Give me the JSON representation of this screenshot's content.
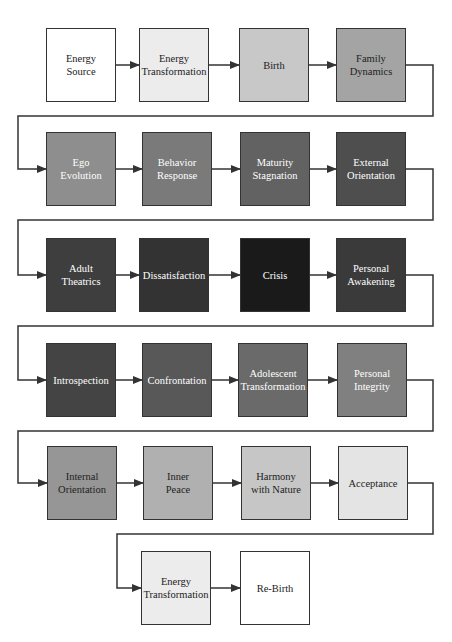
{
  "diagram": {
    "type": "flow-cycle",
    "nodes": [
      {
        "id": "n1",
        "label": "Energy\nSource",
        "fill": "#ffffff",
        "text": "#222222",
        "x": 46,
        "y": 28
      },
      {
        "id": "n2",
        "label": "Energy\nTransformation",
        "fill": "#ececec",
        "text": "#222222",
        "x": 139,
        "y": 28
      },
      {
        "id": "n3",
        "label": "Birth",
        "fill": "#c8c8c8",
        "text": "#222222",
        "x": 239,
        "y": 28
      },
      {
        "id": "n4",
        "label": "Family\nDynamics",
        "fill": "#a4a4a4",
        "text": "#222222",
        "x": 336,
        "y": 28
      },
      {
        "id": "n5",
        "label": "Ego\nEvolution",
        "fill": "#8e8e8e",
        "text": "#ffffff",
        "x": 46,
        "y": 132
      },
      {
        "id": "n6",
        "label": "Behavior\nResponse",
        "fill": "#7a7a7a",
        "text": "#ffffff",
        "x": 142,
        "y": 132
      },
      {
        "id": "n7",
        "label": "Maturity\nStagnation",
        "fill": "#626262",
        "text": "#ffffff",
        "x": 240,
        "y": 132
      },
      {
        "id": "n8",
        "label": "External\nOrientation",
        "fill": "#4e4e4e",
        "text": "#ffffff",
        "x": 336,
        "y": 132
      },
      {
        "id": "n9",
        "label": "Adult\nTheatrics",
        "fill": "#3e3e3e",
        "text": "#ffffff",
        "x": 46,
        "y": 238
      },
      {
        "id": "n10",
        "label": "Dissatisfaction",
        "fill": "#333333",
        "text": "#ffffff",
        "x": 139,
        "y": 238
      },
      {
        "id": "n11",
        "label": "Crisis",
        "fill": "#1a1a1a",
        "text": "#ffffff",
        "x": 240,
        "y": 238
      },
      {
        "id": "n12",
        "label": "Personal\nAwakening",
        "fill": "#3a3a3a",
        "text": "#ffffff",
        "x": 336,
        "y": 238
      },
      {
        "id": "n13",
        "label": "Introspection",
        "fill": "#444444",
        "text": "#ffffff",
        "x": 46,
        "y": 343
      },
      {
        "id": "n14",
        "label": "Confrontation",
        "fill": "#585858",
        "text": "#ffffff",
        "x": 142,
        "y": 343
      },
      {
        "id": "n15",
        "label": "Adolescent\nTransformation",
        "fill": "#6a6a6a",
        "text": "#ffffff",
        "x": 238,
        "y": 343
      },
      {
        "id": "n16",
        "label": "Personal\nIntegrity",
        "fill": "#808080",
        "text": "#ffffff",
        "x": 337,
        "y": 343
      },
      {
        "id": "n17",
        "label": "Internal\nOrientation",
        "fill": "#969696",
        "text": "#222222",
        "x": 47,
        "y": 446
      },
      {
        "id": "n18",
        "label": "Inner\nPeace",
        "fill": "#b0b0b0",
        "text": "#222222",
        "x": 143,
        "y": 446
      },
      {
        "id": "n19",
        "label": "Harmony\nwith Nature",
        "fill": "#c6c6c6",
        "text": "#222222",
        "x": 241,
        "y": 446
      },
      {
        "id": "n20",
        "label": "Acceptance",
        "fill": "#e4e4e4",
        "text": "#222222",
        "x": 338,
        "y": 446
      },
      {
        "id": "n21",
        "label": "Energy\nTransformation",
        "fill": "#ececec",
        "text": "#222222",
        "x": 141,
        "y": 551
      },
      {
        "id": "n22",
        "label": "Re-Birth",
        "fill": "#ffffff",
        "text": "#222222",
        "x": 240,
        "y": 551
      }
    ],
    "edges": [
      [
        "n1",
        "n2"
      ],
      [
        "n2",
        "n3"
      ],
      [
        "n3",
        "n4"
      ],
      [
        "n4",
        "n5"
      ],
      [
        "n5",
        "n6"
      ],
      [
        "n6",
        "n7"
      ],
      [
        "n7",
        "n8"
      ],
      [
        "n8",
        "n9"
      ],
      [
        "n9",
        "n10"
      ],
      [
        "n10",
        "n11"
      ],
      [
        "n11",
        "n12"
      ],
      [
        "n12",
        "n13"
      ],
      [
        "n13",
        "n14"
      ],
      [
        "n14",
        "n15"
      ],
      [
        "n15",
        "n16"
      ],
      [
        "n16",
        "n17"
      ],
      [
        "n17",
        "n18"
      ],
      [
        "n18",
        "n19"
      ],
      [
        "n19",
        "n20"
      ],
      [
        "n20",
        "n21"
      ],
      [
        "n21",
        "n22"
      ]
    ],
    "colors": {
      "line": "#333333",
      "border": "#333333"
    }
  }
}
